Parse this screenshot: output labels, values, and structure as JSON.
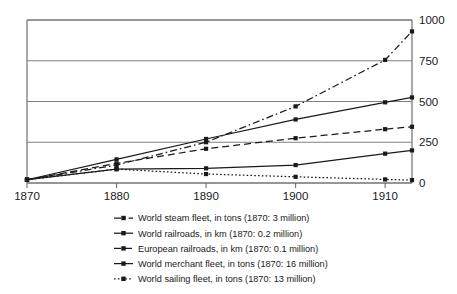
{
  "chart_data": {
    "type": "line",
    "title": "",
    "subtitle": "",
    "xlabel": "",
    "ylabel": "",
    "xlim": [
      1870,
      1913
    ],
    "ylim": [
      0,
      1000
    ],
    "grid": true,
    "grid_axis": "y",
    "legend_position": "bottom",
    "x": [
      1870,
      1880,
      1890,
      1900,
      1910,
      1913
    ],
    "xticks": [
      "1870",
      "1880",
      "1890",
      "1900",
      "1910"
    ],
    "xtick_values": [
      1870,
      1880,
      1890,
      1900,
      1910
    ],
    "yticks": [
      "0",
      "250",
      "500",
      "750",
      "1000"
    ],
    "ytick_values": [
      0,
      250,
      500,
      750,
      1000
    ],
    "y_axis_side": "right",
    "series": [
      {
        "name": "World steam fleet, in tons (1870: 3 million)",
        "style": "dash-dot",
        "marker": "square",
        "color": "#1a1a1a",
        "values": [
          20,
          110,
          250,
          470,
          755,
          930
        ]
      },
      {
        "name": "World railroads, in km (1870: 0.2 million)",
        "style": "solid",
        "marker": "square",
        "color": "#1a1a1a",
        "values": [
          20,
          145,
          270,
          390,
          495,
          525
        ]
      },
      {
        "name": "European railroads, in km (1870: 0.1 million)",
        "style": "dashed",
        "marker": "square",
        "color": "#1a1a1a",
        "values": [
          20,
          120,
          210,
          275,
          330,
          345
        ]
      },
      {
        "name": "World merchant fleet, in tons (1870: 16 million)",
        "style": "solid",
        "marker": "square",
        "color": "#1a1a1a",
        "values": [
          20,
          85,
          90,
          110,
          180,
          200
        ]
      },
      {
        "name": "World sailing fleet, in tons (1870: 13 million)",
        "style": "dotted",
        "marker": "square",
        "color": "#1a1a1a",
        "values": [
          20,
          85,
          55,
          38,
          22,
          18
        ]
      }
    ]
  },
  "legend": {
    "items": [
      {
        "label": "World steam fleet, in tons (1870: 3 million)"
      },
      {
        "label": "World railroads, in km (1870: 0.2 million)"
      },
      {
        "label": "European railroads, in km (1870: 0.1 million)"
      },
      {
        "label": "World merchant fleet, in tons (1870: 16 million)"
      },
      {
        "label": "World sailing fleet, in tons (1870: 13 million)"
      }
    ]
  },
  "axes": {
    "x_tick_labels": [
      "1870",
      "1880",
      "1890",
      "1900",
      "1910"
    ],
    "y_tick_labels": [
      "0",
      "250",
      "500",
      "750",
      "1000"
    ]
  },
  "colors": {
    "line": "#1a1a1a",
    "grid": "#808080",
    "axis": "#6e6e6e",
    "background": "#ffffff"
  }
}
